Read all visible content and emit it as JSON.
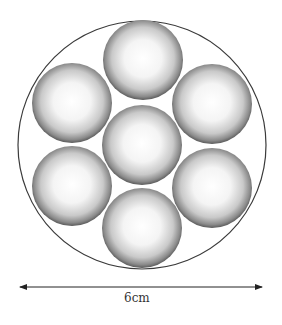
{
  "diagram": {
    "outer_circle": {
      "cx": 142,
      "cy": 145,
      "r": 124,
      "stroke": "#3a3a3a"
    },
    "sphere_radius": 40,
    "spheres": [
      {
        "name": "top",
        "cx": 143,
        "cy": 60
      },
      {
        "name": "upper-left",
        "cx": 72,
        "cy": 103
      },
      {
        "name": "upper-right",
        "cx": 212,
        "cy": 104
      },
      {
        "name": "center",
        "cx": 142,
        "cy": 145
      },
      {
        "name": "lower-left",
        "cx": 72,
        "cy": 186
      },
      {
        "name": "lower-right",
        "cx": 212,
        "cy": 188
      },
      {
        "name": "bottom",
        "cx": 142,
        "cy": 228
      }
    ],
    "dimension": {
      "x1": 20,
      "x2": 262,
      "y": 287,
      "label": "6cm"
    }
  }
}
